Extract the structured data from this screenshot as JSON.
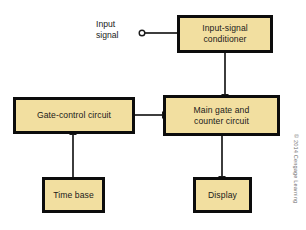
{
  "figure": {
    "type": "block-diagram",
    "background_color": "#ffffff",
    "block_fill_color": "#f2dfa0",
    "block_border_color": "#0c0c0c",
    "connector_color": "#1a1a1a"
  },
  "blocks": [
    {
      "id": "input-signal-conditioner",
      "label": "Input-signal\nconditioner",
      "x": 177,
      "y": 15,
      "width": 96,
      "height": 38
    },
    {
      "id": "gate-control-circuit",
      "label": "Gate-control circuit",
      "x": 13,
      "y": 97,
      "width": 122,
      "height": 37
    },
    {
      "id": "main-gate-counter-circuit",
      "label": "Main gate and\ncounter circuit",
      "x": 163,
      "y": 95,
      "width": 117,
      "height": 41
    },
    {
      "id": "time-base",
      "label": "Time base",
      "x": 42,
      "y": 177,
      "width": 63,
      "height": 36
    },
    {
      "id": "display",
      "label": "Display",
      "x": 193,
      "y": 177,
      "width": 59,
      "height": 36
    }
  ],
  "labels": {
    "input_signal": "Input\nsignal"
  },
  "terminal": {
    "name": "input-signal-terminal",
    "cx": 142,
    "cy": 33,
    "r": 3
  },
  "connectors": [
    {
      "id": "input-terminal-to-conditioner",
      "from": "input-signal-terminal",
      "to": "input-signal-conditioner",
      "arrow": false
    },
    {
      "id": "conditioner-to-main-gate",
      "from": "input-signal-conditioner",
      "to": "main-gate-counter-circuit",
      "arrow": true,
      "direction": "down"
    },
    {
      "id": "gate-control-to-main-gate",
      "from": "gate-control-circuit",
      "to": "main-gate-counter-circuit",
      "arrow": true,
      "direction": "right"
    },
    {
      "id": "time-base-to-gate-control",
      "from": "time-base",
      "to": "gate-control-circuit",
      "arrow": true,
      "direction": "up"
    },
    {
      "id": "main-gate-to-display",
      "from": "main-gate-counter-circuit",
      "to": "display",
      "arrow": true,
      "direction": "down"
    }
  ],
  "credit": {
    "text": "© 2014 Cengage Learning"
  }
}
